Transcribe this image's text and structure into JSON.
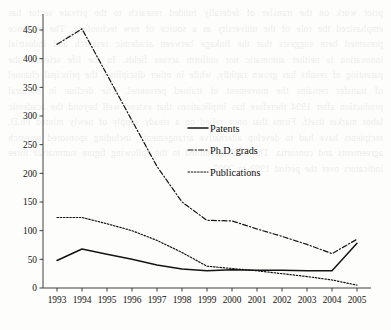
{
  "background_text": "prior work on the  transfer of  federally funded  research to the private sector has emphasized the role of  the university  as a source of  new technology.  The evidence presented here suggests that the  linkage  between  academic  research  and  industrial innovation is  neither automatic nor uniform across fields. In the  life sciences the  patenting  of  results has grown  rapidly, while in other disciplines the  principal channel of  transfer remains the  movement  of trained  personnel.  The decline in  doctoral production  after  1994 therefore has  implications that  extend well  beyond the  academic labor market itself. Firms that  once  relied on  a steady supply of  newly minted  Ph.D. recipients have  had to  develop alternative  arrangements, including  sponsored  research  agreements and  consortia. The  data  assembled in  the  following  figure  summarize  three  indicators over the  period  1993 to  2005.",
  "chart_data": {
    "type": "line",
    "title": "",
    "xlabel": "",
    "ylabel": "",
    "x": [
      1993,
      1994,
      1995,
      1996,
      1997,
      1998,
      1999,
      2000,
      2001,
      2002,
      2003,
      2004,
      2005
    ],
    "xtick_labels": [
      "1993",
      "1994",
      "1995",
      "1996",
      "1997",
      "1998",
      "1999",
      "2000",
      "2001",
      "2002",
      "2003",
      "2004",
      "2005"
    ],
    "ytick_values": [
      0,
      50,
      100,
      150,
      200,
      250,
      300,
      350,
      400,
      450
    ],
    "ytick_labels": [
      "0",
      "50",
      "100",
      "150",
      "200",
      "250",
      "300",
      "350",
      "400",
      "450"
    ],
    "ylim": [
      0,
      470
    ],
    "xlim": [
      1993,
      2005
    ],
    "grid": false,
    "legend_position": "center",
    "series": [
      {
        "name": "Patents",
        "style": "solid",
        "color": "#141414",
        "values": [
          48,
          68,
          59,
          50,
          40,
          33,
          30,
          32,
          31,
          31,
          30,
          30,
          78
        ]
      },
      {
        "name": "Ph.D. grads",
        "style": "dash-dot",
        "color": "#141414",
        "values": [
          425,
          452,
          372,
          292,
          212,
          150,
          118,
          117,
          103,
          90,
          76,
          60,
          85
        ]
      },
      {
        "name": "Publications",
        "style": "dotted",
        "color": "#141414",
        "values": [
          123,
          123,
          112,
          100,
          83,
          62,
          38,
          34,
          30,
          25,
          20,
          14,
          5
        ]
      }
    ]
  },
  "legend": {
    "items": [
      {
        "label": "Patents",
        "style": "solid"
      },
      {
        "label": "Ph.D. grads",
        "style": "dash-dot"
      },
      {
        "label": "Publications",
        "style": "dotted"
      }
    ]
  }
}
